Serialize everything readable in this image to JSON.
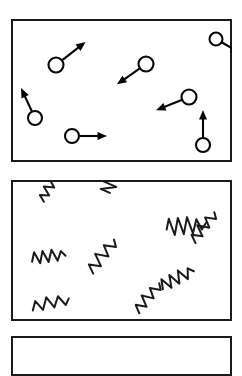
{
  "figure": {
    "background_color": "#ffffff",
    "stroke_color": "#050505",
    "frame_color": "#1a1a1a",
    "width": 242,
    "height": 344
  },
  "panels": [
    {
      "id": "panel-particles",
      "label": "particles-with-velocity-vectors",
      "kind": "particles",
      "x": 11,
      "y": 19,
      "width": 221,
      "height": 143,
      "items": [
        {
          "name": "particle-1",
          "cx": 45,
          "cy": 46,
          "r": 7.5,
          "angle_deg": -38,
          "length": 30
        },
        {
          "name": "particle-2",
          "cx": 205,
          "cy": 20,
          "r": 6.5,
          "angle_deg": 30,
          "length": 22
        },
        {
          "name": "particle-3",
          "cx": 135,
          "cy": 45,
          "r": 7.5,
          "angle_deg": 145,
          "length": 28
        },
        {
          "name": "particle-4",
          "cx": 24,
          "cy": 99,
          "r": 7.0,
          "angle_deg": -115,
          "length": 26
        },
        {
          "name": "particle-5",
          "cx": 178,
          "cy": 78,
          "r": 7.5,
          "angle_deg": 158,
          "length": 28
        },
        {
          "name": "particle-6",
          "cx": 61,
          "cy": 117,
          "r": 7.0,
          "angle_deg": 0,
          "length": 28
        },
        {
          "name": "particle-7",
          "cx": 192,
          "cy": 126,
          "r": 7.0,
          "angle_deg": -90,
          "length": 28
        }
      ]
    },
    {
      "id": "panel-waves",
      "label": "radiation-squiggles",
      "kind": "waves",
      "x": 11,
      "y": 180,
      "width": 221,
      "height": 141,
      "items": [
        {
          "name": "squiggle-1",
          "x": 27,
          "y": 18,
          "rotation_deg": -58,
          "scale": 0.8,
          "style": "zigzag-3"
        },
        {
          "name": "squiggle-2",
          "x": 92,
          "y": 12,
          "rotation_deg": -82,
          "scale": 0.95,
          "style": "zigzag-5"
        },
        {
          "name": "squiggle-3",
          "x": 155,
          "y": 42,
          "rotation_deg": -5,
          "scale": 1.05,
          "style": "zigzag-5"
        },
        {
          "name": "squiggle-4",
          "x": 20,
          "y": 74,
          "rotation_deg": -8,
          "scale": 0.9,
          "style": "zigzag-4"
        },
        {
          "name": "squiggle-5",
          "x": 75,
          "y": 88,
          "rotation_deg": -52,
          "scale": 1.05,
          "style": "zigzag-3"
        },
        {
          "name": "squiggle-6",
          "x": 178,
          "y": 58,
          "rotation_deg": -52,
          "scale": 0.95,
          "style": "zigzag-3"
        },
        {
          "name": "squiggle-7",
          "x": 148,
          "y": 102,
          "rotation_deg": -28,
          "scale": 0.95,
          "style": "zigzag-4"
        },
        {
          "name": "squiggle-8",
          "x": 20,
          "y": 122,
          "rotation_deg": -12,
          "scale": 1.0,
          "style": "zigzag-3"
        },
        {
          "name": "squiggle-9",
          "x": 122,
          "y": 128,
          "rotation_deg": -50,
          "scale": 0.95,
          "style": "zigzag-3"
        }
      ]
    },
    {
      "id": "panel-third",
      "label": "third-panel-cut-off",
      "kind": "empty",
      "x": 11,
      "y": 336,
      "width": 221,
      "height": 40,
      "items": []
    }
  ]
}
